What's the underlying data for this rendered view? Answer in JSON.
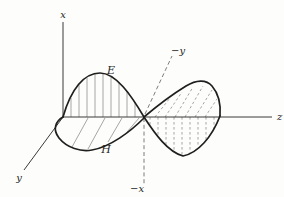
{
  "figure": {
    "colors": {
      "background": "#fdfdfb",
      "ink": "#1f1f1f",
      "axis": "#3a3a3a",
      "hatch": "#8f8f8f",
      "dashed": "#6e6e6e",
      "text": "#1f1f1f"
    },
    "labels": {
      "axis_x": "x",
      "axis_y": "y",
      "axis_z": "z",
      "neg_y": "−y",
      "neg_x": "−x",
      "e_field": "E",
      "h_field": "H"
    }
  }
}
